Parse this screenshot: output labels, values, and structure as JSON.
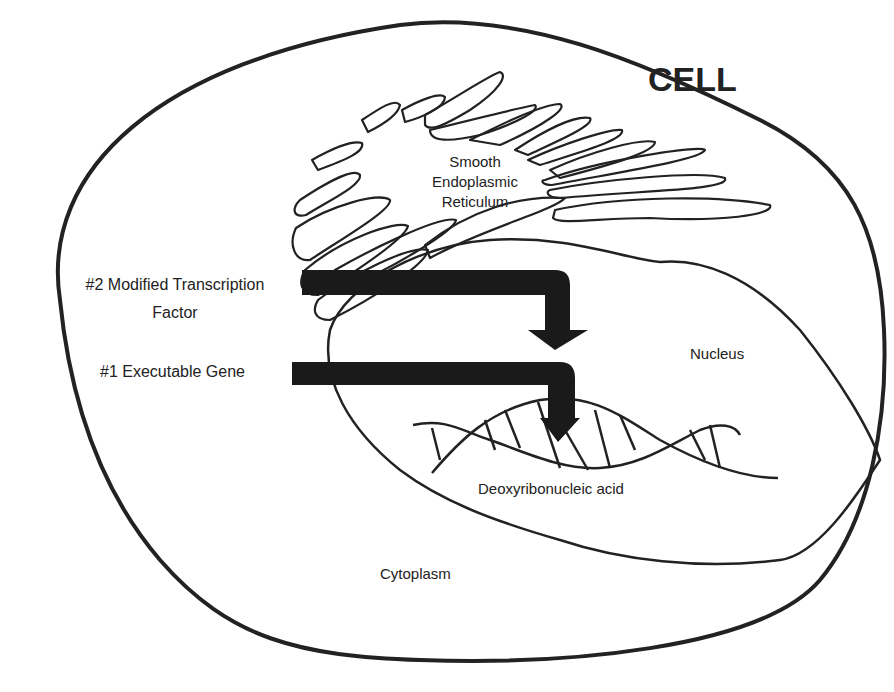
{
  "title": "CELL",
  "labels": {
    "smooth_er": [
      "Smooth",
      "Endoplasmic",
      "Reticulum"
    ],
    "transcription_factor": [
      "#2 Modified Transcription",
      "Factor"
    ],
    "executable_gene": "#1 Executable Gene",
    "nucleus": "Nucleus",
    "dna": "Deoxyribonucleic acid",
    "cytoplasm": "Cytoplasm"
  },
  "colors": {
    "stroke": "#222222",
    "arrow": "#1a1a1a",
    "background": "#ffffff"
  }
}
